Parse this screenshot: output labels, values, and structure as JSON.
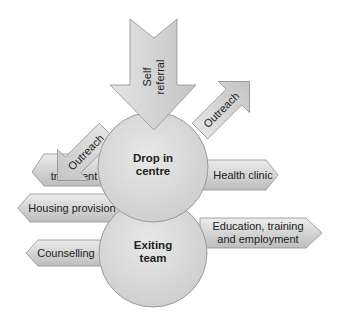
{
  "diagram": {
    "center_nodes": [
      {
        "id": "drop-in-centre",
        "line1": "Drop in",
        "line2": "centre"
      },
      {
        "id": "exiting-team",
        "line1": "Exiting",
        "line2": "team"
      }
    ],
    "inbound": {
      "id": "self-referral",
      "line1": "Self",
      "line2": "referral"
    },
    "outreach": [
      {
        "id": "outreach-left",
        "label": "Outreach"
      },
      {
        "id": "outreach-right",
        "label": "Outreach"
      }
    ],
    "services_left": [
      {
        "id": "drug-treatment",
        "line1": "Drug",
        "line2": "treatment"
      },
      {
        "id": "housing-provision",
        "label": "Housing provision"
      },
      {
        "id": "counselling",
        "label": "Counselling"
      }
    ],
    "services_right": [
      {
        "id": "health-clinic",
        "label": "Health clinic"
      },
      {
        "id": "education",
        "line1": "Education, training",
        "line2": "and employment"
      }
    ],
    "colors": {
      "shape_fill_light": "#e6e6e6",
      "shape_fill_dark": "#b8b8b8",
      "stroke": "#8f8f8f",
      "text": "#222222"
    }
  }
}
